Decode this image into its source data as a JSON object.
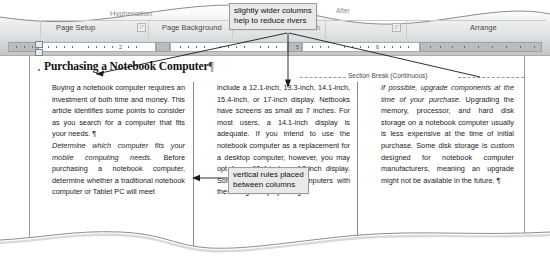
{
  "ribbon": {
    "groups": [
      {
        "label": "Page Setup",
        "x": 56,
        "y": 24
      },
      {
        "label": "Page Background",
        "x": 162,
        "y": 24
      },
      {
        "label": "Arrange",
        "x": 470,
        "y": 24
      }
    ],
    "fragments": [
      {
        "label": "Hyphenation",
        "x": 110,
        "y": 12
      },
      {
        "label": "After",
        "x": 336,
        "y": 9
      },
      {
        "label": "h",
        "x": 316,
        "y": 24
      }
    ],
    "dialog_launcher_glyph": "◸"
  },
  "ruler": {
    "numbers": [
      "2",
      "5",
      "6"
    ],
    "unit": "inches"
  },
  "document": {
    "title": "Purchasing a Notebook Computer",
    "pilcrow": "¶",
    "section_break_label": "Section Break (Continuous)",
    "columns": [
      {
        "id": "column-1",
        "paragraphs": [
          {
            "style": "body",
            "text": "Buying a notebook computer requires an investment of both time and money. This article identifies some points to consider as you search for a computer that fits your needs. ¶"
          },
          {
            "style": "italic-heading",
            "text": "Determine which computer fits your mobile computing needs."
          },
          {
            "style": "body",
            "text": " Before purchasing a notebook computer, determine whether a traditional notebook computer or Tablet PC will meet"
          }
        ]
      },
      {
        "id": "column-2",
        "paragraphs": [
          {
            "style": "body",
            "text": "include a 12.1-inch, 13.3-inch, 14.1-inch, 15.4-inch, or 17-inch display. Netbooks have screens as small as 7 inches. For most users, a 14.1-inch display is adequate. If you intend to use the notebook computer as a replacement for a desktop computer, however, you may opt for a 15.4-inch or 17-inch display. Some of the notebook computers with these larger displays weigh"
          }
        ]
      },
      {
        "id": "column-3",
        "paragraphs": [
          {
            "style": "italic-heading",
            "text": "If possible, upgrade components at the time of your purchase."
          },
          {
            "style": "body",
            "text": " Upgrading the memory, processor, and hard disk storage on a notebook computer usually is less expensive at the time of initial purchase. Some disk storage is custom designed for notebook computer manufacturers, meaning an upgrade might not be available in the future. ¶"
          }
        ]
      }
    ]
  },
  "callouts": [
    {
      "id": "callout-wider-columns",
      "line1": "slightly wider columns",
      "line2": "help to reduce rivers"
    },
    {
      "id": "callout-vertical-rules",
      "line1": "vertical rules placed",
      "line2": "between columns"
    }
  ],
  "colors": {
    "page": "#ffffff",
    "ribbon_bottom": "#d9dcde",
    "ruler": "#c8cccf",
    "callout_fill": "#e9e9e9",
    "callout_border": "#9b9b9b",
    "rule": "#8c8c8c",
    "text": "#1b1b1b"
  }
}
